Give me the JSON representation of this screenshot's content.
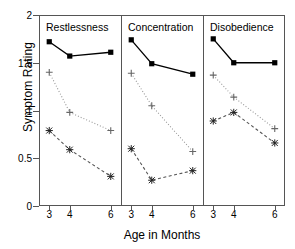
{
  "chart_data": {
    "type": "line",
    "title": "",
    "xlabel": "Age in Months",
    "ylabel": "Symptom Rating",
    "x": [
      3,
      4,
      6
    ],
    "xlim": [
      2.5,
      6.5
    ],
    "ylim": [
      0,
      2
    ],
    "yticks": [
      0,
      0.5,
      1,
      1.5,
      2
    ],
    "ytick_labels": [
      "0",
      "0.5",
      "1",
      "1.5",
      "2"
    ],
    "xtick_labels": [
      "3",
      "4",
      "6"
    ],
    "grid": false,
    "legend": "none",
    "panels": [
      {
        "label": "Restlessness",
        "series": [
          {
            "name": "square-solid",
            "marker": "square",
            "line": "solid",
            "values": [
              1.72,
              1.57,
              1.61
            ]
          },
          {
            "name": "plus-dotted",
            "marker": "plus",
            "line": "dotted",
            "values": [
              1.4,
              0.98,
              0.79
            ]
          },
          {
            "name": "cross-dashed",
            "marker": "cross",
            "line": "dashed",
            "values": [
              0.79,
              0.59,
              0.31
            ]
          }
        ]
      },
      {
        "label": "Concentration",
        "series": [
          {
            "name": "square-solid",
            "marker": "square",
            "line": "solid",
            "values": [
              1.74,
              1.49,
              1.38
            ]
          },
          {
            "name": "plus-dotted",
            "marker": "plus",
            "line": "dotted",
            "values": [
              1.39,
              1.05,
              0.57
            ]
          },
          {
            "name": "cross-dashed",
            "marker": "cross",
            "line": "dashed",
            "values": [
              0.6,
              0.27,
              0.37
            ]
          }
        ]
      },
      {
        "label": "Disobedience",
        "series": [
          {
            "name": "square-solid",
            "marker": "square",
            "line": "solid",
            "values": [
              1.75,
              1.5,
              1.5
            ]
          },
          {
            "name": "plus-dotted",
            "marker": "plus",
            "line": "dotted",
            "values": [
              1.37,
              1.14,
              0.81
            ]
          },
          {
            "name": "cross-dashed",
            "marker": "cross",
            "line": "dashed",
            "values": [
              0.89,
              0.98,
              0.66
            ]
          }
        ]
      }
    ],
    "colors": {
      "axis": "#555555",
      "solid_line": "#000000",
      "dotted_line": "#999999",
      "dashed_line": "#555555",
      "marker": "#000000",
      "background": "#ffffff"
    }
  }
}
